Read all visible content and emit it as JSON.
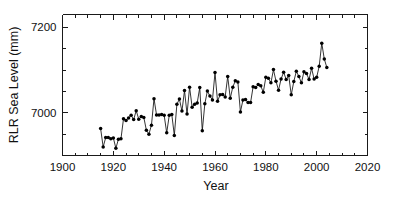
{
  "chart_data": {
    "type": "line",
    "title": "",
    "subtitle": "",
    "xlabel": "Year",
    "ylabel": "RLR Sea Level (mm)",
    "xlim": [
      1900,
      2020
    ],
    "ylim": [
      6900,
      7230
    ],
    "xticks": [
      1900,
      1920,
      1940,
      1960,
      1980,
      2000,
      2020
    ],
    "xticklabels": [
      "1900",
      "1920",
      "1940",
      "1960",
      "1980",
      "2000",
      "2020"
    ],
    "yticks": [
      7000,
      7200
    ],
    "yticklabels": [
      "7000",
      "7200"
    ],
    "minor_xtick_interval": 5,
    "minor_ytick_interval": 50,
    "grid": false,
    "legend": null,
    "marker": "filled-circle",
    "marker_color": "#000000",
    "line_color": "#111111",
    "series": [
      {
        "name": "RLR Sea Level",
        "x": [
          1915,
          1916,
          1917,
          1918,
          1919,
          1920,
          1921,
          1922,
          1923,
          1924,
          1925,
          1926,
          1927,
          1928,
          1929,
          1930,
          1931,
          1932,
          1933,
          1934,
          1935,
          1936,
          1937,
          1938,
          1939,
          1940,
          1941,
          1942,
          1943,
          1944,
          1945,
          1946,
          1947,
          1948,
          1949,
          1950,
          1951,
          1952,
          1953,
          1954,
          1955,
          1956,
          1957,
          1958,
          1959,
          1960,
          1961,
          1962,
          1963,
          1964,
          1965,
          1966,
          1967,
          1968,
          1969,
          1970,
          1971,
          1972,
          1973,
          1974,
          1975,
          1976,
          1977,
          1978,
          1979,
          1980,
          1981,
          1982,
          1983,
          1984,
          1985,
          1986,
          1987,
          1988,
          1989,
          1990,
          1991,
          1992,
          1993,
          1994,
          1995,
          1996,
          1997,
          1998,
          1999,
          2000,
          2001,
          2002,
          2003,
          2004
        ],
        "values": [
          6963,
          6920,
          6942,
          6942,
          6939,
          6941,
          6917,
          6938,
          6939,
          6986,
          6982,
          6988,
          6994,
          6984,
          7005,
          6985,
          6991,
          6989,
          6959,
          6950,
          6971,
          7033,
          6995,
          6995,
          6996,
          6994,
          6953,
          6994,
          6996,
          6947,
          7020,
          7032,
          7004,
          7052,
          6997,
          7060,
          7013,
          7020,
          7023,
          7059,
          6958,
          7021,
          7051,
          7039,
          7030,
          7094,
          7027,
          7042,
          7043,
          7037,
          7085,
          7034,
          7060,
          7075,
          7072,
          7002,
          7030,
          7031,
          7024,
          7024,
          7061,
          7059,
          7066,
          7063,
          7048,
          7083,
          7081,
          7070,
          7101,
          7074,
          7053,
          7079,
          7095,
          7078,
          7087,
          7042,
          7073,
          7097,
          7085,
          7070,
          7096,
          7092,
          7078,
          7104,
          7079,
          7083,
          7109,
          7163,
          7126,
          7106
        ]
      }
    ]
  },
  "axis": {
    "x_title": "Year",
    "y_title": "RLR Sea Level (mm)"
  }
}
